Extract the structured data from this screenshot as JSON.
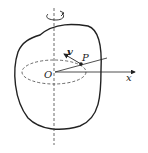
{
  "diagram": {
    "labels": {
      "origin": "O",
      "point": "P",
      "velocity": "v",
      "x_axis": "x"
    },
    "colors": {
      "stroke": "#222222",
      "background": "#ffffff"
    },
    "elements": [
      "body-outline",
      "rotation-axis",
      "rotation-arrow",
      "circular-path",
      "radius-line",
      "x-axis",
      "velocity-vector",
      "point-p"
    ]
  }
}
